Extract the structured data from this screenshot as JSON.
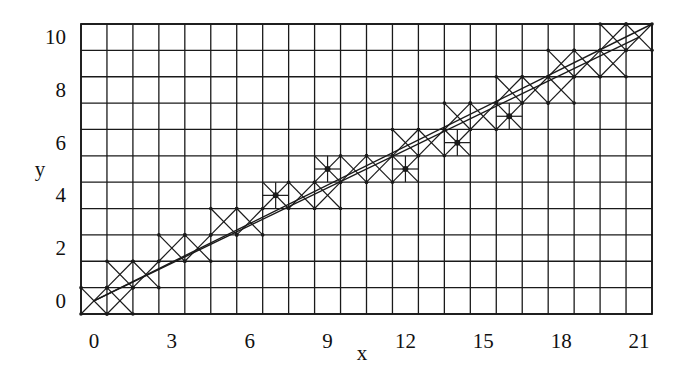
{
  "chart_data": {
    "type": "scatter",
    "title": "",
    "xlabel": "x",
    "ylabel": "y",
    "xlim": [
      0,
      21
    ],
    "ylim": [
      0,
      10
    ],
    "grid": true,
    "x_ticks": [
      0,
      3,
      6,
      9,
      12,
      15,
      18,
      21
    ],
    "y_ticks": [
      0,
      2,
      4,
      6,
      8,
      10
    ],
    "series": [
      {
        "name": "cross-cells",
        "marker": "x-in-cell",
        "points": [
          [
            0,
            0
          ],
          [
            1,
            0
          ],
          [
            1,
            1
          ],
          [
            2,
            1
          ],
          [
            3,
            2
          ],
          [
            4,
            2
          ],
          [
            5,
            3
          ],
          [
            6,
            3
          ],
          [
            8,
            4
          ],
          [
            9,
            4
          ],
          [
            10,
            5
          ],
          [
            11,
            5
          ],
          [
            12,
            6
          ],
          [
            13,
            6
          ],
          [
            14,
            7
          ],
          [
            15,
            7
          ],
          [
            16,
            8
          ],
          [
            17,
            8
          ],
          [
            18,
            8
          ],
          [
            18,
            9
          ],
          [
            19,
            9
          ],
          [
            20,
            9
          ],
          [
            20,
            10
          ],
          [
            21,
            10
          ]
        ]
      },
      {
        "name": "star-cells",
        "marker": "asterisk-in-cell",
        "points": [
          [
            7,
            4
          ],
          [
            9,
            5
          ],
          [
            12,
            5
          ],
          [
            14,
            6
          ],
          [
            16,
            7
          ]
        ]
      },
      {
        "name": "trend-lines",
        "marker": "line",
        "lines": [
          [
            [
              0,
              0
            ],
            [
              21,
              10
            ]
          ],
          [
            [
              0,
              0
            ],
            [
              21.5,
              10.5
            ]
          ]
        ]
      }
    ]
  },
  "axes": {
    "x_label": "x",
    "y_label": "y",
    "x_tick_labels": [
      "0",
      "3",
      "6",
      "9",
      "12",
      "15",
      "18",
      "21"
    ],
    "y_tick_labels": [
      "0",
      "2",
      "4",
      "6",
      "8",
      "10"
    ]
  },
  "style": {
    "line_color": "#1a1a1a",
    "background": "#ffffff"
  }
}
